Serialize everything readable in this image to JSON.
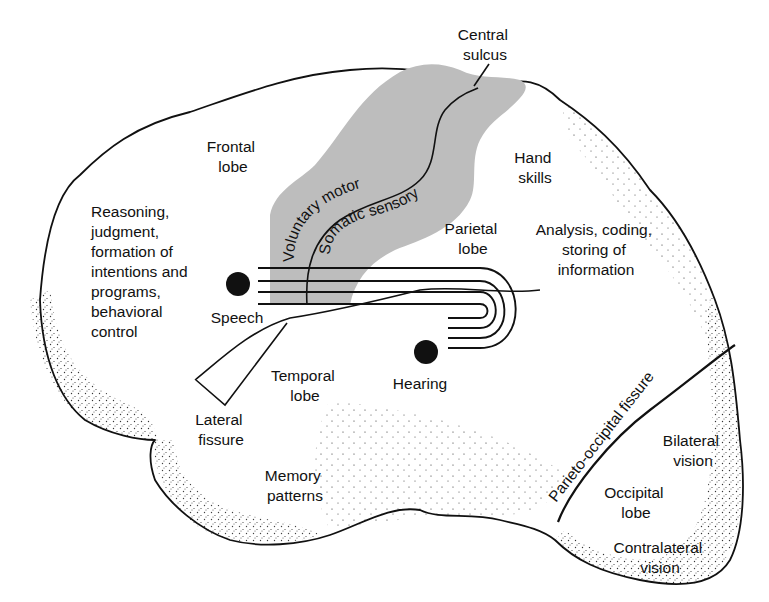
{
  "diagram": {
    "colors": {
      "outline": "#111111",
      "band_fill": "#bdbdbd",
      "background": "#ffffff",
      "dots": "#111111"
    },
    "labels": {
      "central_sulcus": [
        "Central",
        "sulcus"
      ],
      "frontal_lobe": [
        "Frontal",
        "lobe"
      ],
      "hand_skills": [
        "Hand",
        "skills"
      ],
      "reasoning": [
        "Reasoning,",
        "judgment,",
        "formation of",
        "intentions and",
        "programs,",
        "behavioral",
        "control"
      ],
      "voluntary_motor": "Voluntary motor",
      "somatic_sensory": "Somatic sensory",
      "parietal_lobe": [
        "Parietal",
        "lobe"
      ],
      "analysis": [
        "Analysis, coding,",
        "storing of",
        "information"
      ],
      "speech": "Speech",
      "hearing": "Hearing",
      "temporal_lobe": [
        "Temporal",
        "lobe"
      ],
      "lateral_fissure": [
        "Lateral",
        "fissure"
      ],
      "memory_patterns": [
        "Memory",
        "patterns"
      ],
      "parieto_occipital_fissure": "Parieto-occipital fissure",
      "bilateral_vision": [
        "Bilateral",
        "vision"
      ],
      "occipital_lobe": [
        "Occipital",
        "lobe"
      ],
      "contralateral_vision": [
        "Contralateral",
        "vision"
      ]
    }
  }
}
